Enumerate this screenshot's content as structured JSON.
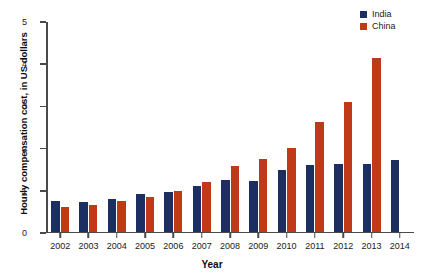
{
  "chart_data": {
    "type": "bar",
    "title": "",
    "xlabel": "Year",
    "ylabel": "Hourly compensation cost, in US dollars",
    "categories": [
      "2002",
      "2003",
      "2004",
      "2005",
      "2006",
      "2007",
      "2008",
      "2009",
      "2010",
      "2011",
      "2012",
      "2013",
      "2014"
    ],
    "series": [
      {
        "name": "India",
        "color": "#1B2F63",
        "values": [
          0.72,
          0.7,
          0.78,
          0.89,
          0.94,
          1.08,
          1.22,
          1.2,
          1.46,
          1.58,
          1.59,
          1.6,
          1.7
        ]
      },
      {
        "name": "China",
        "color": "#C03A1A",
        "values": [
          0.57,
          0.62,
          0.72,
          0.82,
          0.96,
          1.17,
          1.55,
          1.73,
          1.98,
          2.6,
          3.07,
          4.12,
          null
        ]
      }
    ],
    "ylim": [
      0,
      5
    ],
    "yticks": [
      0,
      1,
      2,
      3,
      4,
      5
    ],
    "ytick_labels": [
      "0",
      "1",
      "2",
      "3",
      "4",
      "5"
    ],
    "grid": false,
    "legend_position": "top-right",
    "axis_color": "#4a4a4a",
    "background": "#ffffff"
  },
  "legend": {
    "items": [
      {
        "label": "India",
        "color": "#1B2F63"
      },
      {
        "label": "China",
        "color": "#C03A1A"
      }
    ]
  }
}
